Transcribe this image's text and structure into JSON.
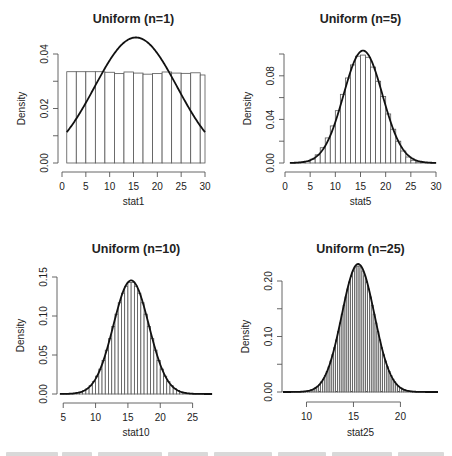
{
  "figure": {
    "background": "#ffffff",
    "bar_fill": "#ffffff",
    "bar_stroke": "#555555",
    "curve_color": "#111111",
    "axis_color": "#555555",
    "text_color": "#222222"
  },
  "chart_data": [
    {
      "type": "bar",
      "subtype": "histogram_with_density_curve",
      "title": "Uniform (n=1)",
      "xlabel": "stat1",
      "ylabel": "Density",
      "xlim": [
        0,
        30
      ],
      "ylim": [
        0,
        0.047
      ],
      "xticks": [
        0,
        5,
        10,
        15,
        20,
        25,
        30
      ],
      "yticks": [
        0.0,
        0.01,
        0.02,
        0.03,
        0.04
      ],
      "ytick_labels": [
        "0.00",
        "",
        "0.02",
        "",
        "0.04"
      ],
      "grid": false,
      "bins": {
        "start": 1,
        "width": 2,
        "count": 15
      },
      "bin_edges": [
        1,
        3,
        5,
        7,
        9,
        11,
        13,
        15,
        17,
        19,
        21,
        23,
        25,
        27,
        29,
        30
      ],
      "values": [
        0.0335,
        0.0335,
        0.0335,
        0.0335,
        0.0333,
        0.0328,
        0.0334,
        0.033,
        0.0326,
        0.0328,
        0.0334,
        0.033,
        0.0329,
        0.0331,
        0.0323
      ],
      "curve": {
        "type": "normal",
        "mean": 15.5,
        "sd": 8.66,
        "x_range": [
          1,
          30
        ],
        "peak": 0.046
      }
    },
    {
      "type": "bar",
      "subtype": "histogram_with_density_curve",
      "title": "Uniform (n=5)",
      "xlabel": "stat5",
      "ylabel": "Density",
      "xlim": [
        0,
        30
      ],
      "ylim": [
        0,
        0.104
      ],
      "xticks": [
        0,
        5,
        10,
        15,
        20,
        25,
        30
      ],
      "yticks": [
        0.0,
        0.02,
        0.04,
        0.06,
        0.08,
        0.1
      ],
      "ytick_labels": [
        "0.00",
        "",
        "0.04",
        "",
        "0.08",
        ""
      ],
      "grid": false,
      "bins": {
        "start": 1,
        "width": 1,
        "count": 29
      },
      "values": [
        0.0001,
        0.0003,
        0.0007,
        0.0015,
        0.0035,
        0.0075,
        0.014,
        0.023,
        0.034,
        0.048,
        0.063,
        0.078,
        0.09,
        0.098,
        0.099,
        0.097,
        0.088,
        0.075,
        0.061,
        0.045,
        0.031,
        0.02,
        0.011,
        0.0055,
        0.0025,
        0.001,
        0.0004,
        0.0002,
        0.0001
      ],
      "curve": {
        "type": "normal",
        "mean": 15.5,
        "sd": 3.87,
        "x_range": [
          1,
          30
        ],
        "peak": 0.103
      }
    },
    {
      "type": "bar",
      "subtype": "histogram_with_density_curve",
      "title": "Uniform (n=10)",
      "xlabel": "stat10",
      "ylabel": "Density",
      "xlim": [
        4.5,
        28
      ],
      "ylim": [
        0,
        0.15
      ],
      "xticks": [
        5,
        10,
        15,
        20,
        25
      ],
      "yticks": [
        0.0,
        0.05,
        0.1,
        0.15
      ],
      "ytick_labels": [
        "0.00",
        "0.05",
        "0.10",
        "0.15"
      ],
      "grid": false,
      "bins": {
        "start": 4.5,
        "width": 0.5,
        "count": 47
      },
      "curve": {
        "type": "normal",
        "mean": 15.5,
        "sd": 2.74,
        "x_range": [
          4.5,
          28
        ],
        "peak": 0.146
      }
    },
    {
      "type": "bar",
      "subtype": "histogram_with_density_curve",
      "title": "Uniform (n=25)",
      "xlabel": "stat25",
      "ylabel": "Density",
      "xlim": [
        7.5,
        24
      ],
      "ylim": [
        0,
        0.23
      ],
      "xticks": [
        10,
        15,
        20
      ],
      "yticks": [
        0.0,
        0.05,
        0.1,
        0.15,
        0.2
      ],
      "ytick_labels": [
        "0.00",
        "",
        "0.10",
        "",
        "0.20"
      ],
      "grid": false,
      "bins": {
        "start": 7.5,
        "width": 0.2,
        "count": 82
      },
      "curve": {
        "type": "normal",
        "mean": 15.5,
        "sd": 1.73,
        "x_range": [
          7.5,
          24
        ],
        "peak": 0.231
      }
    }
  ],
  "layout": {
    "panels": [
      {
        "title_y": 23,
        "x0": 62,
        "x1": 205,
        "y0": 163,
        "yTop": 54,
        "yAxisX": 58,
        "xAxisY": 172,
        "xlabel_y": 205
      },
      {
        "title_y": 23,
        "x0": 285,
        "x1": 436,
        "y0": 163,
        "yTop": 54,
        "yAxisX": 284,
        "xAxisY": 172,
        "xlabel_y": 205
      },
      {
        "title_y": 253,
        "x0": 60,
        "x1": 212,
        "y0": 394,
        "yTop": 277,
        "yAxisX": 57,
        "xAxisY": 403,
        "xlabel_y": 436
      },
      {
        "title_y": 253,
        "x0": 283,
        "x1": 438,
        "y0": 392,
        "yTop": 281,
        "yAxisX": 282,
        "xAxisY": 402,
        "xlabel_y": 436
      }
    ]
  }
}
